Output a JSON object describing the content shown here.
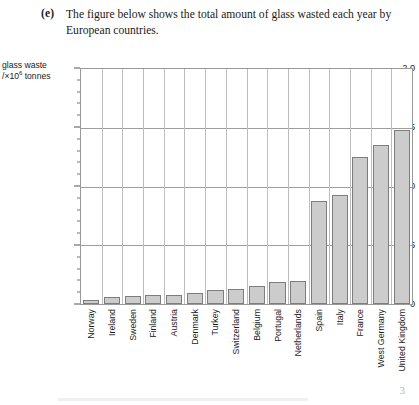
{
  "question": {
    "label": "(e)",
    "text": "The figure below shows the total amount of glass wasted each year by European countries."
  },
  "chart": {
    "y_axis_caption_line1": "glass waste",
    "y_axis_caption_line2_prefix": "/×10",
    "y_axis_caption_exponent": "6",
    "y_axis_caption_line2_suffix": " tonnes"
  },
  "footer": {
    "page_number": "3"
  },
  "colors": {
    "bar_fill": "#cccccc",
    "bar_stroke": "#7d7d7d",
    "gridline": "#9e9e9e",
    "frame": "#9a9a9a",
    "text": "#1a1a1a"
  },
  "chart_data": {
    "type": "bar",
    "title": "",
    "xlabel": "",
    "ylabel": "glass waste /×10⁶ tonnes",
    "ylim": [
      0,
      2.0
    ],
    "ytick_labels": [
      "0",
      "0.5",
      "1.0",
      "1.5",
      "2.0"
    ],
    "ytick_values": [
      0,
      0.5,
      1.0,
      1.5,
      2.0
    ],
    "minor_tick_step": 0.1,
    "grid": "horizontal-major-and-vertical-category",
    "legend": "none",
    "categories": [
      "Norway",
      "Ireland",
      "Sweden",
      "Finland",
      "Austria",
      "Denmark",
      "Turkey",
      "Switzerland",
      "Belgium",
      "Portugal",
      "Netherlands",
      "Spain",
      "Italy",
      "France",
      "West Germany",
      "United Kingdom"
    ],
    "values": [
      0.03,
      0.06,
      0.07,
      0.08,
      0.08,
      0.09,
      0.12,
      0.13,
      0.15,
      0.19,
      0.2,
      0.88,
      0.93,
      1.25,
      1.35,
      1.48
    ]
  }
}
